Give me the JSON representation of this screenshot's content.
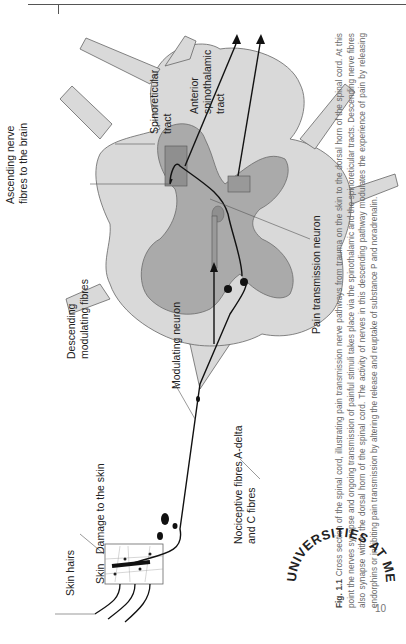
{
  "page": {
    "number": "10",
    "orientation": "rotated-90-ccw"
  },
  "figure": {
    "labels": {
      "skin_hairs": "Skin hairs",
      "skin": "Skin",
      "damage": "Damage to the skin",
      "descending_1": "Descending",
      "descending_2": "modulating fibres",
      "ascending_1": "Ascending nerve",
      "ascending_2": "fibres to the brain",
      "spinoreticular_1": "Spinoreticular",
      "spinoreticular_2": "tract",
      "anterior_1": "Anterior",
      "anterior_2": "spinothalamic",
      "anterior_3": "tract",
      "modulating_neuron": "Modulating neuron",
      "nociceptive_1": "Nociceptive fibres A-delta",
      "nociceptive_2": "and C fibres",
      "pain_neuron": "Pain transmission neuron"
    },
    "caption": {
      "fig_label": "Fig. 1.1",
      "text": "Cross section of the spinal cord, illustrating pain transmission nerve pathways from trauma on the skin to the dorsal horn of the spinal cord. At this point the nerves synapse and ongoing transmission of painful stimuli takes place via the spinothalamic and the spinoreticular tracts. Descending nerve fibres also synapse within the dorsal horn of the spinal cord. The activity of nerves in this descending pathway modulates the experience of pain by releasing endorphins or inhibiting pain transmission by altering the release and reuptake of substance P and noradrenalin."
    }
  },
  "stamp": {
    "text": "UNIVERSITIES AT MEDWAY LIBRARY"
  },
  "colors": {
    "cord_light": "#d9d9d9",
    "cord_grey": "#a8a8a8",
    "outline": "#666666",
    "nerve": "#111111",
    "text": "#222222",
    "caption": "#666666"
  }
}
